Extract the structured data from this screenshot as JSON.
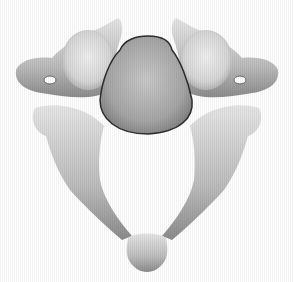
{
  "image": {
    "subject": "cervical vertebra illustration",
    "view": "superior",
    "style": "grayscale shaded drawing",
    "background": "#ffffff",
    "colors": {
      "bone_light": "#dcdcdc",
      "bone_mid": "#b4b4b4",
      "bone_dark": "#7a7a7a",
      "outline": "#3a3a3a"
    }
  }
}
